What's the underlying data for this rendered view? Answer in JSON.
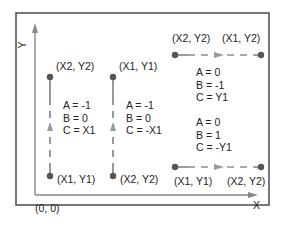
{
  "axes": {
    "y_label": "Y",
    "x_label": "X",
    "origin_label": "(0, 0)"
  },
  "segments": [
    {
      "name": "left-vertical",
      "top_label": "(X2, Y2)",
      "bottom_label": "(X1, Y1)",
      "equations": [
        "A = -1",
        "B = 0",
        "C = X1"
      ]
    },
    {
      "name": "middle-vertical",
      "top_label": "(X1, Y1)",
      "bottom_label": "(X2, Y2)",
      "equations": [
        "A = -1",
        "B = 0",
        "C = -X1"
      ]
    },
    {
      "name": "top-horizontal",
      "left_label": "(X2, Y2)",
      "right_label": "(X1, Y2)",
      "equations": [
        "A = 0",
        "B = -1",
        "C = Y1"
      ]
    },
    {
      "name": "bottom-horizontal",
      "left_label": "(X1, Y1)",
      "right_label": "(X2, Y2)",
      "equations": [
        "A = 0",
        "B = 1",
        "C = -Y1"
      ]
    }
  ],
  "colors": {
    "frame": "#555555",
    "axis": "#888888",
    "line": "#555555",
    "arrow": "#999999",
    "point": "#555555"
  }
}
